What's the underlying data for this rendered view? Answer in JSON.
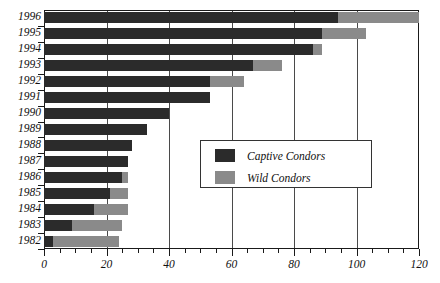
{
  "chart_data": {
    "type": "bar",
    "orientation": "horizontal",
    "stacked": true,
    "title": "",
    "xlabel": "",
    "ylabel": "",
    "xlim": [
      0,
      120
    ],
    "ylim": null,
    "grid": true,
    "gridlines_x": [
      20,
      40,
      60,
      80,
      100
    ],
    "xticks_major": [
      0,
      20,
      40,
      60,
      80,
      100,
      120
    ],
    "xticks_minor_step": 5,
    "xtick_labels": [
      "0",
      "20",
      "40",
      "60",
      "80",
      "100",
      "120"
    ],
    "categories": [
      "1996",
      "1995",
      "1994",
      "1993",
      "1992",
      "1991",
      "1990",
      "1989",
      "1988",
      "1987",
      "1986",
      "1985",
      "1984",
      "1983",
      "1982"
    ],
    "legend_position": "center-right",
    "series": [
      {
        "name": "Captive Condors",
        "color": "#2b2b2b",
        "values": [
          94,
          89,
          86,
          67,
          53,
          53,
          40,
          33,
          28,
          27,
          25,
          21,
          16,
          9,
          3
        ]
      },
      {
        "name": "Wild Condors",
        "color": "#8a8a8a",
        "values": [
          26,
          14,
          3,
          9,
          11,
          0,
          0,
          0,
          0,
          0,
          2,
          6,
          11,
          16,
          21
        ]
      }
    ],
    "totals": [
      120,
      103,
      89,
      76,
      64,
      53,
      40,
      33,
      28,
      27,
      27,
      27,
      27,
      25,
      24
    ]
  },
  "legend": {
    "items": [
      {
        "label": "Captive Condors",
        "swatch": "#2b2b2b"
      },
      {
        "label": "Wild Condors",
        "swatch": "#8a8a8a"
      }
    ]
  }
}
